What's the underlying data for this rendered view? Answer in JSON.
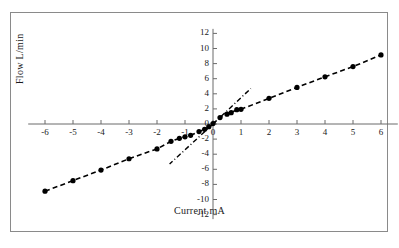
{
  "chart_data": {
    "type": "scatter",
    "title": "",
    "xlabel": "Current  mA",
    "ylabel": "Flow  L/min",
    "xlim": [
      -6.6,
      6.6
    ],
    "ylim": [
      -12.6,
      12.6
    ],
    "xticks": [
      -6,
      -5,
      -4,
      -3,
      -2,
      -1,
      0,
      1,
      2,
      3,
      4,
      5,
      6
    ],
    "xticklabels": [
      "-6",
      "-5",
      "-4",
      "-3",
      "-2",
      "-1",
      "0",
      "1",
      "2",
      "3",
      "4",
      "5",
      "6"
    ],
    "yticks": [
      -12,
      -10,
      -8,
      -6,
      -4,
      -2,
      0,
      2,
      4,
      6,
      8,
      10,
      12
    ],
    "yticklabels": [
      "-12",
      "-10",
      "-8",
      "-6",
      "-4",
      "-2",
      "0",
      "2",
      "4",
      "6",
      "8",
      "10",
      "12"
    ],
    "grid": false,
    "legend": null,
    "axes_style": "crossed-at-origin",
    "series": [
      {
        "name": "Flow vs Current",
        "marker": "filled-circle",
        "line": "dashed",
        "color": "#000000",
        "points": [
          {
            "x": -6.0,
            "y": -8.9
          },
          {
            "x": -5.0,
            "y": -7.5
          },
          {
            "x": -4.0,
            "y": -6.1
          },
          {
            "x": -3.0,
            "y": -4.6
          },
          {
            "x": -2.0,
            "y": -3.3
          },
          {
            "x": -1.5,
            "y": -2.3
          },
          {
            "x": -1.2,
            "y": -1.9
          },
          {
            "x": -1.0,
            "y": -1.7
          },
          {
            "x": -0.8,
            "y": -1.5
          },
          {
            "x": -0.5,
            "y": -1.0
          },
          {
            "x": -0.3,
            "y": -0.7
          },
          {
            "x": -0.15,
            "y": -0.35
          },
          {
            "x": 0.0,
            "y": 0.05
          },
          {
            "x": 0.25,
            "y": 0.85
          },
          {
            "x": 0.5,
            "y": 1.3
          },
          {
            "x": 0.65,
            "y": 1.5
          },
          {
            "x": 0.85,
            "y": 1.9
          },
          {
            "x": 1.0,
            "y": 1.95
          },
          {
            "x": 2.0,
            "y": 3.4
          },
          {
            "x": 3.0,
            "y": 4.85
          },
          {
            "x": 4.0,
            "y": 6.25
          },
          {
            "x": 5.0,
            "y": 7.6
          },
          {
            "x": 6.0,
            "y": 9.15
          }
        ]
      }
    ],
    "annotations": [
      {
        "name": "tangent-line-upper",
        "style": "dash-dot",
        "from": {
          "x": 0.0,
          "y": 0.0
        },
        "to": {
          "x": 1.35,
          "y": 4.7
        }
      },
      {
        "name": "tangent-line-lower",
        "style": "dash-dot",
        "from": {
          "x": 0.0,
          "y": 0.0
        },
        "to": {
          "x": -1.55,
          "y": -5.3
        }
      }
    ]
  }
}
